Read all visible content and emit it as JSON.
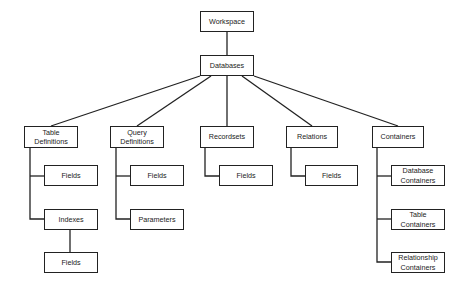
{
  "diagram": {
    "type": "tree",
    "nodes": {
      "workspace": "Workspace",
      "databases": "Databases",
      "table_definitions": "Table\nDefinitions",
      "query_definitions": "Query\nDefinitions",
      "recordsets": "Recordsets",
      "relations": "Relations",
      "containers": "Containers",
      "td_fields": "Fields",
      "indexes": "Indexes",
      "idx_fields": "Fields",
      "qd_fields": "Fields",
      "parameters": "Parameters",
      "rs_fields": "Fields",
      "rel_fields": "Fields",
      "database_containers": "Database\nContainers",
      "table_containers": "Table\nContainers",
      "relationship_containers": "Relationship\nContainers"
    },
    "edges": [
      [
        "workspace",
        "databases"
      ],
      [
        "databases",
        "table_definitions"
      ],
      [
        "databases",
        "query_definitions"
      ],
      [
        "databases",
        "recordsets"
      ],
      [
        "databases",
        "relations"
      ],
      [
        "databases",
        "containers"
      ],
      [
        "table_definitions",
        "td_fields"
      ],
      [
        "table_definitions",
        "indexes"
      ],
      [
        "indexes",
        "idx_fields"
      ],
      [
        "query_definitions",
        "qd_fields"
      ],
      [
        "query_definitions",
        "parameters"
      ],
      [
        "recordsets",
        "rs_fields"
      ],
      [
        "relations",
        "rel_fields"
      ],
      [
        "containers",
        "database_containers"
      ],
      [
        "containers",
        "table_containers"
      ],
      [
        "containers",
        "relationship_containers"
      ]
    ]
  }
}
